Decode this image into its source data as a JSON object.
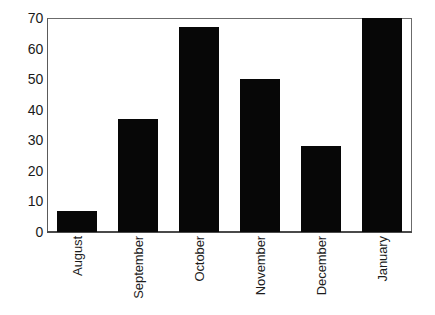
{
  "chart_data": {
    "type": "bar",
    "title": "",
    "subtitle": "",
    "xlabel": "",
    "ylabel": "",
    "categories": [
      "August",
      "September",
      "October",
      "November",
      "December",
      "January"
    ],
    "values": [
      7,
      37,
      67,
      50,
      28,
      70
    ],
    "series": [
      {
        "name": "",
        "values": [
          7,
          37,
          67,
          50,
          28,
          70
        ]
      }
    ],
    "ylim": [
      0,
      70
    ],
    "yticks": [
      0,
      10,
      20,
      30,
      40,
      50,
      60,
      70
    ],
    "ytick_labels": [
      "0",
      "10",
      "20",
      "30",
      "40",
      "50",
      "60",
      "70"
    ],
    "grid": false,
    "legend": false,
    "legend_position": "none",
    "annotations": [],
    "bar_color": "#070707",
    "background_color": "#ffffff",
    "axis_color": "#5a5a5a",
    "xtick_label_rotation": 90
  }
}
